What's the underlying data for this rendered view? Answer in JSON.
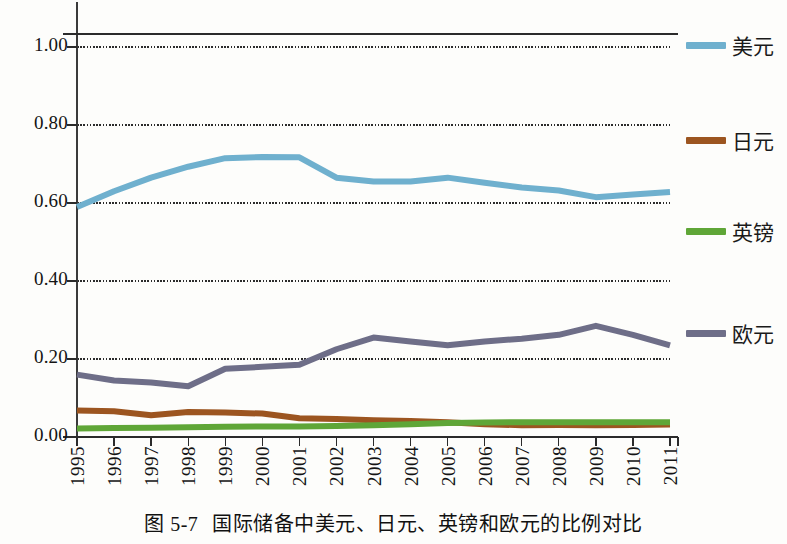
{
  "figure": {
    "caption_number": "图 5-7",
    "caption_text": "国际储备中美元、日元、英镑和欧元的比例对比"
  },
  "legend": {
    "items": [
      {
        "label": "美元",
        "color": "#6FB0CE"
      },
      {
        "label": "日元",
        "color": "#9C5520"
      },
      {
        "label": "英镑",
        "color": "#5FA637"
      },
      {
        "label": "欧元",
        "color": "#6E6E88"
      }
    ]
  },
  "axes": {
    "y_ticks": [
      "1.00",
      "0.80",
      "0.60",
      "0.40",
      "0.20",
      "0.00"
    ],
    "x_ticks": [
      "1995",
      "1996",
      "1997",
      "1998",
      "1999",
      "2000",
      "2001",
      "2002",
      "2003",
      "2004",
      "2005",
      "2006",
      "2007",
      "2008",
      "2009",
      "2010",
      "2011"
    ]
  },
  "chart_data": {
    "type": "line",
    "title": "国际储备中美元、日元、英镑和欧元的比例对比",
    "xlabel": "",
    "ylabel": "",
    "ylim": [
      0.0,
      1.1
    ],
    "yticks": [
      0.0,
      0.2,
      0.4,
      0.6,
      0.8,
      1.0
    ],
    "grid": true,
    "legend_position": "right",
    "categories": [
      "1995",
      "1996",
      "1997",
      "1998",
      "1999",
      "2000",
      "2001",
      "2002",
      "2003",
      "2004",
      "2005",
      "2006",
      "2007",
      "2008",
      "2009",
      "2010",
      "2011"
    ],
    "series": [
      {
        "name": "美元",
        "color": "#6FB0CE",
        "values": [
          0.59,
          0.63,
          0.665,
          0.693,
          0.715,
          0.718,
          0.717,
          0.665,
          0.655,
          0.655,
          0.665,
          0.652,
          0.64,
          0.632,
          0.615,
          0.622,
          0.628
        ]
      },
      {
        "name": "日元",
        "color": "#9C5520",
        "values": [
          0.068,
          0.066,
          0.056,
          0.064,
          0.063,
          0.06,
          0.048,
          0.046,
          0.043,
          0.041,
          0.038,
          0.033,
          0.03,
          0.031,
          0.03,
          0.031,
          0.032
        ]
      },
      {
        "name": "英镑",
        "color": "#5FA637",
        "values": [
          0.022,
          0.023,
          0.024,
          0.025,
          0.026,
          0.027,
          0.027,
          0.028,
          0.03,
          0.033,
          0.036,
          0.037,
          0.038,
          0.038,
          0.038,
          0.038,
          0.038
        ]
      },
      {
        "name": "欧元",
        "color": "#6E6E88",
        "values": [
          0.16,
          0.145,
          0.14,
          0.13,
          0.175,
          0.18,
          0.185,
          0.225,
          0.255,
          0.245,
          0.235,
          0.245,
          0.252,
          0.262,
          0.285,
          0.262,
          0.235
        ]
      }
    ]
  }
}
